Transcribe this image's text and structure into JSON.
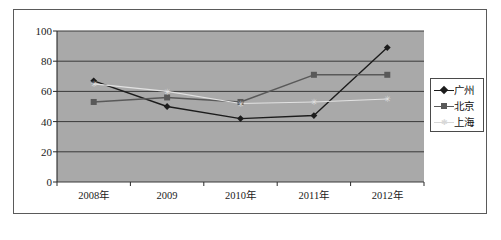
{
  "chart_data": {
    "type": "line",
    "title": "",
    "subtitle": "",
    "xlabel": "",
    "ylabel": "",
    "categories": [
      "2008年",
      "2009",
      "2010年",
      "2011年",
      "2012年"
    ],
    "ylim": [
      0,
      100
    ],
    "ytick_labels": [
      "0",
      "20",
      "40",
      "60",
      "80",
      "100"
    ],
    "ytick_values": [
      0,
      20,
      40,
      60,
      80,
      100
    ],
    "grid": true,
    "grid_axis": "y",
    "legend_position": "right",
    "plot_background": "#a9a9a9",
    "series": [
      {
        "name": "广州",
        "values": [
          67,
          50,
          42,
          44,
          89
        ],
        "color": "#1c1c1c",
        "marker": "diamond"
      },
      {
        "name": "北京",
        "values": [
          53,
          56,
          53,
          71,
          71
        ],
        "color": "#595959",
        "marker": "square"
      },
      {
        "name": "上海",
        "values": [
          65,
          60,
          52,
          53,
          55
        ],
        "color": "#e2e2e2",
        "marker": "star"
      }
    ]
  },
  "legend": {
    "entries": [
      {
        "label": "广州"
      },
      {
        "label": "北京"
      },
      {
        "label": "上海"
      }
    ]
  }
}
